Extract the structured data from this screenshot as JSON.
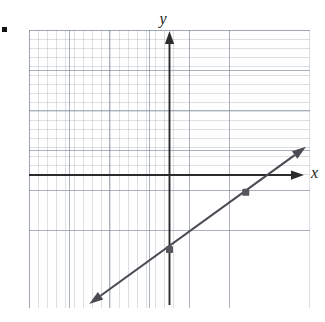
{
  "figure": {
    "bullet_marker": "▪",
    "background_color": "#ffffff"
  },
  "axes": {
    "y_label": "y",
    "x_label": "x",
    "axis_color": "#2b2b2b",
    "grid_color": "#8c96a5"
  },
  "chart_data": {
    "type": "line",
    "title": "",
    "xlabel": "x",
    "ylabel": "y",
    "grid": true,
    "legend": null,
    "xlim": [
      -3.5,
      3.5
    ],
    "ylim": [
      -3.3,
      3.6
    ],
    "series": [
      {
        "name": "line",
        "color": "#4a4a52",
        "style": "solid",
        "arrow_start": true,
        "arrow_end": true,
        "x": [
          -2.0,
          0.0,
          1.9,
          3.4
        ],
        "y": [
          -3.2,
          -1.85,
          -0.43,
          0.7
        ],
        "equation_slope": 0.727,
        "equation_intercept": -1.85,
        "endpoint_start": [
          -2.0,
          -3.2
        ],
        "endpoint_end": [
          3.4,
          0.7
        ]
      }
    ],
    "points": [
      {
        "label": "y-intercept",
        "x": 0.0,
        "y": -1.85,
        "color": "#55555d"
      },
      {
        "label": "second-point",
        "x": 1.9,
        "y": -0.43,
        "color": "#55555d"
      }
    ]
  }
}
